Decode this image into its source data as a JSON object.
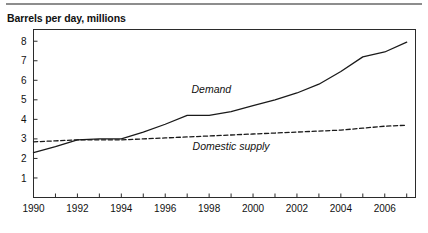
{
  "header": {
    "rule_color": "#8d8d8d"
  },
  "chart_data": {
    "type": "line",
    "title": "Barrels per day, millions",
    "xlabel": "",
    "ylabel": "",
    "xlim": [
      1990,
      2007.4
    ],
    "ylim": [
      0,
      8.6
    ],
    "grid": false,
    "legend": "inline-annotations",
    "x_ticks": [
      1990,
      1991,
      1992,
      1993,
      1994,
      1995,
      1996,
      1997,
      1998,
      1999,
      2000,
      2001,
      2002,
      2003,
      2004,
      2005,
      2006,
      2007
    ],
    "x_tick_labels": [
      "1990",
      "",
      "1992",
      "",
      "1994",
      "",
      "1996",
      "",
      "1998",
      "",
      "2000",
      "",
      "2002",
      "",
      "2004",
      "",
      "2006",
      ""
    ],
    "y_ticks": [
      1,
      2,
      3,
      4,
      5,
      6,
      7,
      8
    ],
    "y_tick_labels": [
      "1",
      "2",
      "3",
      "4",
      "5",
      "6",
      "7",
      "8"
    ],
    "x": [
      1990,
      1991,
      1992,
      1993,
      1994,
      1995,
      1996,
      1997,
      1998,
      1999,
      2000,
      2001,
      2002,
      2003,
      2004,
      2005,
      2006,
      2007
    ],
    "series": [
      {
        "name": "Demand",
        "style": "solid",
        "color": "#1a1a1a",
        "label_x": 1998.1,
        "label_y": 5.35,
        "values": [
          2.3,
          2.6,
          2.95,
          3.0,
          3.0,
          3.35,
          3.75,
          4.2,
          4.2,
          4.4,
          4.7,
          5.0,
          5.35,
          5.8,
          6.45,
          7.2,
          7.45,
          7.95
        ]
      },
      {
        "name": "Domestic supply",
        "style": "dashed",
        "color": "#1a1a1a",
        "label_x": 1999.0,
        "label_y": 2.45,
        "values": [
          2.85,
          2.9,
          2.95,
          2.95,
          2.95,
          3.0,
          3.05,
          3.1,
          3.15,
          3.2,
          3.25,
          3.3,
          3.35,
          3.4,
          3.45,
          3.55,
          3.65,
          3.7
        ]
      }
    ]
  }
}
